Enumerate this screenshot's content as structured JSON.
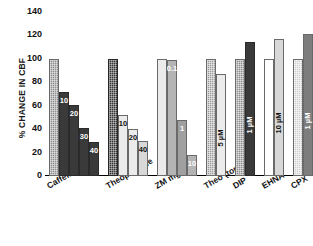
{
  "chart_data": {
    "type": "bar",
    "title": "",
    "subtitle": "",
    "xlabel": "",
    "ylabel": "% CHANGE IN CBF",
    "ylim": [
      0,
      140
    ],
    "yticks": [
      0,
      20,
      40,
      60,
      80,
      100,
      120,
      140
    ],
    "grid": false,
    "legend": "none",
    "categories": [
      "Caffeine",
      "Theophylline",
      "ZM mg/kg",
      "Theo (topical)",
      "DIP",
      "EHNA",
      "CPX"
    ],
    "groups": [
      {
        "category": "Caffeine",
        "bars": [
          {
            "label": "",
            "value": 100,
            "fill": "tex-gray",
            "label_color": "white",
            "label_rot": true
          },
          {
            "label": "10",
            "value": 72,
            "fill": "fill-dark",
            "label_color": "white",
            "label_rot": false
          },
          {
            "label": "20",
            "value": 61,
            "fill": "fill-dark",
            "label_color": "white",
            "label_rot": false
          },
          {
            "label": "30",
            "value": 41,
            "fill": "fill-dark",
            "label_color": "white",
            "label_rot": false
          },
          {
            "label": "40",
            "value": 29,
            "fill": "fill-dark",
            "label_color": "white",
            "label_rot": false
          }
        ]
      },
      {
        "category": "Theophylline",
        "bars": [
          {
            "label": "",
            "value": 100,
            "fill": "tex-dark",
            "label_color": "white",
            "label_rot": true
          },
          {
            "label": "10",
            "value": 52,
            "fill": "fill-vlight",
            "label_color": "black",
            "label_rot": false
          },
          {
            "label": "20",
            "value": 40,
            "fill": "fill-vlight",
            "label_color": "black",
            "label_rot": false
          },
          {
            "label": "40",
            "value": 30,
            "fill": "fill-light",
            "label_color": "black",
            "label_rot": false
          }
        ]
      },
      {
        "category": "ZM mg/kg",
        "bars": [
          {
            "label": "",
            "value": 100,
            "fill": "fill-vlight",
            "label_color": "white",
            "label_rot": true
          },
          {
            "label": "0.1",
            "value": 99,
            "fill": "fill-gray70",
            "label_color": "white",
            "label_rot": false
          },
          {
            "label": "1",
            "value": 48,
            "fill": "fill-gray60",
            "label_color": "white",
            "label_rot": false
          },
          {
            "label": "10",
            "value": 18,
            "fill": "fill-gray70",
            "label_color": "white",
            "label_rot": false
          }
        ]
      },
      {
        "category": "Theo (topical)",
        "bars": [
          {
            "label": "",
            "value": 100,
            "fill": "tex-mid",
            "label_color": "white",
            "label_rot": true
          },
          {
            "label": "5 µM",
            "value": 87,
            "fill": "fill-vlight",
            "label_color": "black",
            "label_rot": true
          }
        ]
      },
      {
        "category": "DIP",
        "bars": [
          {
            "label": "",
            "value": 100,
            "fill": "tex-gray",
            "label_color": "white",
            "label_rot": true
          },
          {
            "label": "1 µM",
            "value": 114,
            "fill": "fill-dark",
            "label_color": "white",
            "label_rot": true
          }
        ]
      },
      {
        "category": "EHNA",
        "bars": [
          {
            "label": "",
            "value": 100,
            "fill": "fill-white",
            "label_color": "black",
            "label_rot": true
          },
          {
            "label": "10 µM",
            "value": 117,
            "fill": "fill-light",
            "label_color": "black",
            "label_rot": true
          }
        ]
      },
      {
        "category": "CPX",
        "bars": [
          {
            "label": "",
            "value": 100,
            "fill": "tex-light",
            "label_color": "black",
            "label_rot": true
          },
          {
            "label": "1 µM",
            "value": 121,
            "fill": "fill-gray45",
            "label_color": "white",
            "label_rot": true
          }
        ]
      }
    ],
    "colors": {
      "axis": "#000000",
      "text": "#111111",
      "dark_bar": "#3a3a3a",
      "light_bar": "#d8d8d8",
      "mid_bar": "#8f8f8f",
      "background": "#ffffff"
    }
  }
}
